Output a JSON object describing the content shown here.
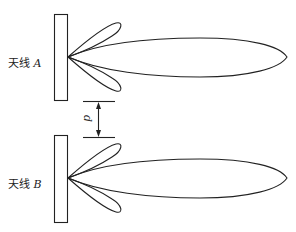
{
  "diagram": {
    "type": "antenna radiation pattern comparison",
    "stroke_color": "#222222",
    "background": "#ffffff",
    "antennas": [
      {
        "id": "A",
        "label_prefix": "天线",
        "label_var": "A",
        "pattern": {
          "main_lobe": "long narrow lobe to the right",
          "side_lobes": 2
        }
      },
      {
        "id": "B",
        "label_prefix": "天线",
        "label_var": "B",
        "pattern": {
          "main_lobe": "long narrow lobe to the right",
          "side_lobes": 2
        }
      }
    ],
    "separation": {
      "symbol": "d",
      "description": "vertical spacing between antennas"
    }
  }
}
